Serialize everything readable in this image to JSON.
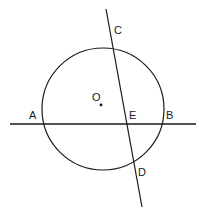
{
  "figure": {
    "stroke_color": "#1a1a1a",
    "label_color": "#1a1a1a",
    "background_color": "#ffffff",
    "canvas": {
      "width": 206,
      "height": 215
    }
  },
  "circle": {
    "name": "circle-O",
    "center_label": "O",
    "cx": 103,
    "cy": 109,
    "r": 61
  },
  "center_dot": {
    "name": "center-point-O",
    "cx": 101,
    "cy": 105,
    "r": 1.4
  },
  "secant_line_AB": {
    "name": "line-AB",
    "x1": 10,
    "y1": 124,
    "x2": 196,
    "y2": 124
  },
  "chord_line_CD": {
    "name": "line-CD",
    "x1": 106,
    "y1": 9,
    "x2": 142,
    "y2": 207
  },
  "labels": [
    {
      "id": "A",
      "text": "A",
      "x": 29,
      "y": 110
    },
    {
      "id": "B",
      "text": "B",
      "x": 166,
      "y": 110
    },
    {
      "id": "C",
      "text": "C",
      "x": 114,
      "y": 25
    },
    {
      "id": "D",
      "text": "D",
      "x": 138,
      "y": 167
    },
    {
      "id": "E",
      "text": "E",
      "x": 129,
      "y": 110
    },
    {
      "id": "O",
      "text": "O",
      "x": 92,
      "y": 92
    }
  ]
}
